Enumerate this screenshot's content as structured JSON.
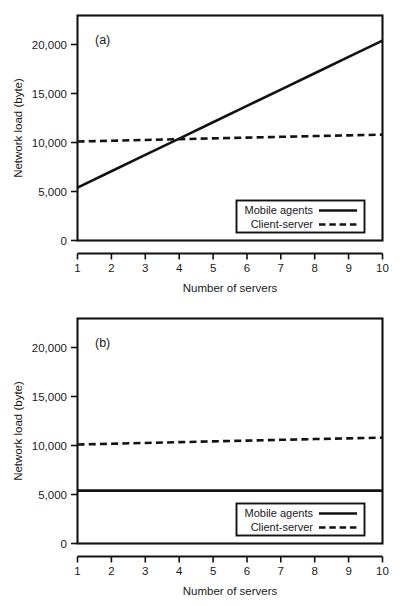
{
  "figure": {
    "background": "#ffffff",
    "ink_color": "#121212",
    "panels": [
      "a",
      "b"
    ]
  },
  "chart_data": [
    {
      "type": "line",
      "panel_tag": "(a)",
      "title": "",
      "xlabel": "Number of servers",
      "ylabel": "Network load (byte)",
      "x": [
        1,
        2,
        3,
        4,
        5,
        6,
        7,
        8,
        9,
        10
      ],
      "xlim": [
        1,
        10
      ],
      "ylim": [
        0,
        22500
      ],
      "xticks": [
        1,
        2,
        3,
        4,
        5,
        6,
        7,
        8,
        9,
        10
      ],
      "xtick_labels": [
        "1",
        "2",
        "3",
        "4",
        "5",
        "6",
        "7",
        "8",
        "9",
        "10"
      ],
      "yticks": [
        0,
        5000,
        10000,
        15000,
        20000
      ],
      "ytick_labels": [
        "0",
        "5,000",
        "10,000",
        "15,000",
        "20,000"
      ],
      "grid": false,
      "legend_position": "lower-right",
      "series": [
        {
          "name": "Mobile agents",
          "style": "solid",
          "color": "#121212",
          "values": [
            5400,
            7070,
            8740,
            10400,
            12070,
            13740,
            15400,
            17070,
            18740,
            20400
          ]
        },
        {
          "name": "Client-server",
          "style": "dashed",
          "color": "#121212",
          "values": [
            10100,
            10180,
            10260,
            10340,
            10420,
            10500,
            10580,
            10660,
            10730,
            10800
          ]
        }
      ],
      "annotations": [
        "Mobile agents line crosses Client-server line near 4 servers"
      ]
    },
    {
      "type": "line",
      "panel_tag": "(b)",
      "title": "",
      "xlabel": "Number of servers",
      "ylabel": "Network load (byte)",
      "x": [
        1,
        2,
        3,
        4,
        5,
        6,
        7,
        8,
        9,
        10
      ],
      "xlim": [
        1,
        10
      ],
      "ylim": [
        0,
        22500
      ],
      "xticks": [
        1,
        2,
        3,
        4,
        5,
        6,
        7,
        8,
        9,
        10
      ],
      "xtick_labels": [
        "1",
        "2",
        "3",
        "4",
        "5",
        "6",
        "7",
        "8",
        "9",
        "10"
      ],
      "yticks": [
        0,
        5000,
        10000,
        15000,
        20000
      ],
      "ytick_labels": [
        "0",
        "5,000",
        "10,000",
        "15,000",
        "20,000"
      ],
      "grid": false,
      "legend_position": "lower-right",
      "series": [
        {
          "name": "Mobile agents",
          "style": "solid",
          "color": "#121212",
          "values": [
            5400,
            5400,
            5400,
            5400,
            5400,
            5400,
            5400,
            5400,
            5400,
            5400
          ]
        },
        {
          "name": "Client-server",
          "style": "dashed",
          "color": "#121212",
          "values": [
            10100,
            10180,
            10260,
            10340,
            10420,
            10500,
            10580,
            10660,
            10730,
            10800
          ]
        }
      ],
      "annotations": [
        "Mobile agents load is constant and stays below Client-server at all server counts"
      ]
    }
  ]
}
